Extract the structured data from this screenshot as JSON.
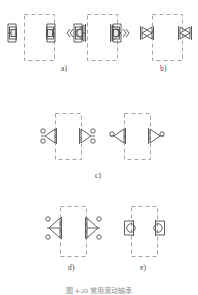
{
  "figure": {
    "caption": "图 4-20  常用滚动轴承",
    "stroke_color": "#4d4d4d",
    "dash_color": "#9a9a9a",
    "background": "#ffffff",
    "labels": [
      {
        "id": "a",
        "text": "a)"
      },
      {
        "id": "b",
        "text": "b)"
      },
      {
        "id": "c",
        "text": "c)"
      },
      {
        "id": "d",
        "text": "d)"
      },
      {
        "id": "e",
        "text": "e)"
      }
    ],
    "groups": [
      {
        "id": "a",
        "label": "a)",
        "housings": [
          {
            "name": "housing-a-left",
            "x": 24,
            "y": 14,
            "w": 30,
            "h": 46
          },
          {
            "name": "housing-a-right",
            "x": 87,
            "y": 14,
            "w": 30,
            "h": 46
          }
        ],
        "bearing_symbol": "square-ball-bearing",
        "bearings": [
          {
            "name": "bearing-a1",
            "cx": 13,
            "cy": 33
          },
          {
            "name": "bearing-a2",
            "cx": 51,
            "cy": 33
          },
          {
            "name": "bearing-a3",
            "cx": 78,
            "cy": 33
          },
          {
            "name": "bearing-a4",
            "cx": 117,
            "cy": 33
          }
        ]
      },
      {
        "id": "b",
        "label": "b)",
        "housings": [
          {
            "name": "housing-b-left",
            "x": 152,
            "y": 14,
            "w": 30,
            "h": 46
          }
        ],
        "bearing_symbol": "bowtie-tapered-bearing",
        "bearings": [
          {
            "name": "bearing-b1",
            "cx": 147,
            "cy": 33
          },
          {
            "name": "bearing-b2",
            "cx": 185,
            "cy": 33
          }
        ]
      },
      {
        "id": "c",
        "label": "c)",
        "housings": [
          {
            "name": "housing-c-left",
            "x": 55,
            "y": 113,
            "w": 26,
            "h": 46
          },
          {
            "name": "housing-c-right",
            "x": 124,
            "y": 113,
            "w": 26,
            "h": 46
          }
        ],
        "bearing_symbol": "angular-contact-bearing",
        "bearings": [
          {
            "name": "bearing-c1",
            "cx": 50,
            "cy": 136
          },
          {
            "name": "bearing-c2",
            "cx": 86,
            "cy": 136
          },
          {
            "name": "bearing-c3",
            "cx": 119,
            "cy": 136
          },
          {
            "name": "bearing-c4",
            "cx": 155,
            "cy": 136
          }
        ]
      },
      {
        "id": "d",
        "label": "d)",
        "housings": [
          {
            "name": "housing-d",
            "x": 60,
            "y": 206,
            "w": 26,
            "h": 50
          }
        ],
        "bearing_symbol": "thrust-bearing",
        "bearings": [
          {
            "name": "bearing-d1",
            "cx": 56,
            "cy": 228
          },
          {
            "name": "bearing-d2",
            "cx": 91,
            "cy": 228
          }
        ]
      },
      {
        "id": "e",
        "label": "e)",
        "housings": [
          {
            "name": "housing-e",
            "x": 131,
            "y": 206,
            "w": 26,
            "h": 50
          }
        ],
        "bearing_symbol": "cylindrical-roller-bearing",
        "bearings": [
          {
            "name": "bearing-e1",
            "cx": 127,
            "cy": 228
          },
          {
            "name": "bearing-e2",
            "cx": 162,
            "cy": 228
          }
        ]
      }
    ]
  }
}
